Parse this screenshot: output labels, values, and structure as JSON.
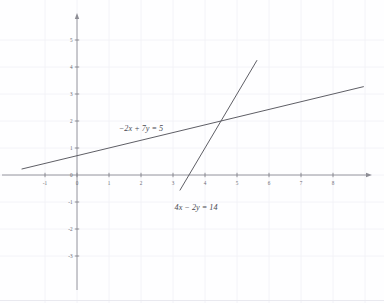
{
  "chart_data": {
    "type": "line",
    "title": "",
    "subtitle": "",
    "xlabel": "",
    "ylabel": "",
    "xlim": [
      -1.75,
      9.3
    ],
    "ylim": [
      -3.85,
      5.7
    ],
    "grid": true,
    "grid_spacing": 1,
    "legend_position": "inline-annotations",
    "axis_arrows": true,
    "xticks": [
      -1,
      0,
      1,
      2,
      3,
      4,
      5,
      6,
      7,
      8
    ],
    "xtick_labels": [
      "-1",
      "0",
      "1",
      "2",
      "3",
      "4",
      "5",
      "6",
      "7",
      "8"
    ],
    "yticks": [
      -3,
      -2,
      -1,
      0,
      1,
      2,
      3,
      4,
      5
    ],
    "ytick_labels": [
      "-3",
      "-2",
      "-1",
      "0",
      "1",
      "2",
      "3",
      "4",
      "5"
    ],
    "series": [
      {
        "name": "-2x + 7y = 5",
        "equation": "−2x + 7y = 5",
        "slope": 0.2857142857,
        "intercept": 0.7142857143,
        "x": [
          -1.72,
          8.95
        ],
        "y": [
          0.2229,
          3.2714
        ],
        "color": "#55555d",
        "label_x": 2.0,
        "label_y": 1.62
      },
      {
        "name": "4x - 2y = 14",
        "equation": "4x − 2y = 14",
        "slope": 2.0,
        "intercept": -7.0,
        "x": [
          3.22,
          5.62
        ],
        "y": [
          -0.56,
          4.24
        ],
        "color": "#55555d",
        "label_x": 3.72,
        "label_y": -1.3
      }
    ],
    "intersection": {
      "x": 4.5,
      "y": 2.0
    },
    "annotations": [
      {
        "text": "−2x + 7y = 5",
        "x": 2.0,
        "y": 1.62
      },
      {
        "text": "4x − 2y = 14",
        "x": 3.72,
        "y": -1.3
      }
    ]
  },
  "axes": {
    "x_axis_name": "x-axis",
    "y_axis_name": "y-axis",
    "origin_label": "0",
    "axis_color": "#8d8d95",
    "grid_color": "#f1f1f6",
    "tick_color": "#7a7a82"
  }
}
